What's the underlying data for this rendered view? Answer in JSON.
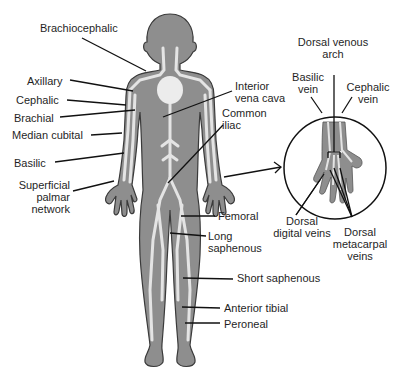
{
  "diagram": {
    "type": "anatomical-venous-system",
    "colors": {
      "body_fill": "#8e8e8e",
      "body_outline": "#3a3a3a",
      "vein": "#e4e4e4",
      "heart": "#ececec",
      "leader_line": "#111111",
      "text": "#1f1f1f"
    },
    "labels_left": [
      {
        "text": "Brachiocephalic"
      },
      {
        "text": "Axillary"
      },
      {
        "text": "Cephalic"
      },
      {
        "text": "Brachial"
      },
      {
        "text": "Median cubital"
      },
      {
        "text": "Basilic"
      },
      {
        "text_lines": [
          "Superficial",
          "palmar",
          "network"
        ]
      }
    ],
    "labels_right": [
      {
        "text_lines": [
          "Interior",
          "vena cava"
        ]
      },
      {
        "text_lines": [
          "Common",
          "iliac"
        ]
      },
      {
        "text": "Femoral"
      },
      {
        "text_lines": [
          "Long",
          "saphenous"
        ]
      },
      {
        "text": "Short saphenous"
      },
      {
        "text": "Anterior tibial"
      },
      {
        "text": "Peroneal"
      }
    ],
    "hand_inset": {
      "labels": [
        {
          "text_lines": [
            "Dorsal venous",
            "arch"
          ]
        },
        {
          "text_lines": [
            "Basilic",
            "vein"
          ]
        },
        {
          "text_lines": [
            "Cephalic",
            "vein"
          ]
        },
        {
          "text_lines": [
            "Dorsal",
            "digital veins"
          ]
        },
        {
          "text_lines": [
            "Dorsal",
            "metacarpal",
            "veins"
          ]
        }
      ]
    }
  }
}
